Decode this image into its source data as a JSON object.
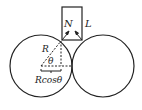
{
  "diagram": {
    "labels": {
      "normal_force": "N",
      "length": "L",
      "radius": "R",
      "angle": "θ",
      "horizontal": "Rcosθ"
    },
    "colors": {
      "stroke": "#222222",
      "background": "#ffffff"
    }
  }
}
